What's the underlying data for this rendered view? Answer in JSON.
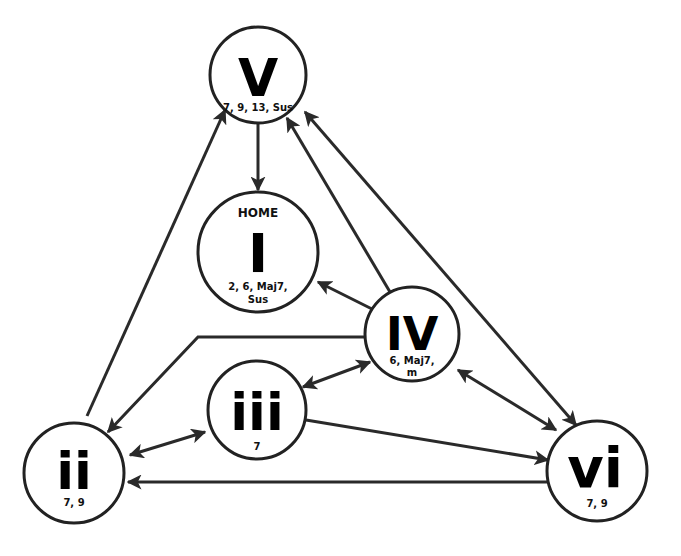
{
  "diagram": {
    "nodes": {
      "V": {
        "numeral": "V",
        "extensions_line1": "7, 9, 13, Sus",
        "extensions_line2": ""
      },
      "I": {
        "numeral": "I",
        "label_top": "HOME",
        "extensions_line1": "2, 6, Maj7,",
        "extensions_line2": "Sus"
      },
      "IV": {
        "numeral": "IV",
        "extensions_line1": "6, Maj7,",
        "extensions_line2": "m"
      },
      "iii": {
        "numeral": "iii",
        "extensions_line1": "7",
        "extensions_line2": ""
      },
      "ii": {
        "numeral": "ii",
        "extensions_line1": "7, 9",
        "extensions_line2": ""
      },
      "vi": {
        "numeral": "vi",
        "extensions_line1": "7, 9",
        "extensions_line2": ""
      }
    },
    "edges": [
      {
        "from": "V",
        "to": "I",
        "direction": "one-way"
      },
      {
        "from": "IV",
        "to": "I",
        "direction": "one-way"
      },
      {
        "from": "IV",
        "to": "V",
        "direction": "one-way"
      },
      {
        "from": "vi",
        "to": "V",
        "direction": "two-way"
      },
      {
        "from": "ii",
        "to": "V",
        "direction": "one-way"
      },
      {
        "from": "IV",
        "to": "ii",
        "direction": "one-way"
      },
      {
        "from": "iii",
        "to": "IV",
        "direction": "two-way"
      },
      {
        "from": "ii",
        "to": "iii",
        "direction": "two-way"
      },
      {
        "from": "iii",
        "to": "vi",
        "direction": "one-way"
      },
      {
        "from": "vi",
        "to": "ii",
        "direction": "one-way"
      },
      {
        "from": "IV",
        "to": "vi",
        "direction": "two-way"
      }
    ],
    "colors": {
      "stroke": "#222222",
      "background": "#ffffff",
      "text": "#000000"
    }
  }
}
